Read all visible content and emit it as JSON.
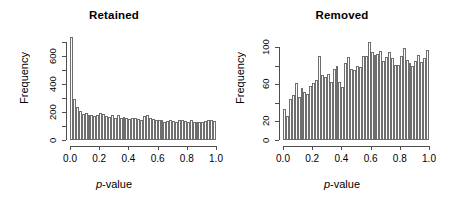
{
  "figure": {
    "background": "#ffffff",
    "bar_fill": "#fdfdfd",
    "bar_stroke": "#6e6e6e",
    "axis_color": "#4d4d4d"
  },
  "panels": [
    {
      "title": "Retained",
      "xlabel_italic": "p",
      "xlabel_rest": "-value",
      "ylabel": "Frequency"
    },
    {
      "title": "Removed",
      "xlabel_italic": "p",
      "xlabel_rest": "-value",
      "ylabel": "Frequency"
    }
  ],
  "chart_data": [
    {
      "type": "bar",
      "title": "Retained",
      "xlabel": "p-value",
      "ylabel": "Frequency",
      "xlim": [
        0,
        1
      ],
      "ylim": [
        0,
        740
      ],
      "xticks": [
        0.0,
        0.2,
        0.4,
        0.6,
        0.8,
        1.0
      ],
      "xtick_labels": [
        "0.0",
        "0.2",
        "0.4",
        "0.6",
        "0.8",
        "1.0"
      ],
      "yticks": [
        0,
        100,
        200,
        300,
        400,
        500,
        600,
        700
      ],
      "ytick_labels": [
        "0",
        "",
        "200",
        "",
        "400",
        "",
        "600",
        ""
      ],
      "grid": false,
      "legend": null,
      "bin_width": 0.02,
      "bin_centers": [
        0.01,
        0.03,
        0.05,
        0.07,
        0.09,
        0.11,
        0.13,
        0.15,
        0.17,
        0.19,
        0.21,
        0.23,
        0.25,
        0.27,
        0.29,
        0.31,
        0.33,
        0.35,
        0.37,
        0.39,
        0.41,
        0.43,
        0.45,
        0.47,
        0.49,
        0.51,
        0.53,
        0.55,
        0.57,
        0.59,
        0.61,
        0.63,
        0.65,
        0.67,
        0.69,
        0.71,
        0.73,
        0.75,
        0.77,
        0.79,
        0.81,
        0.83,
        0.85,
        0.87,
        0.89,
        0.91,
        0.93,
        0.95,
        0.97,
        0.99
      ],
      "values": [
        735,
        290,
        235,
        210,
        185,
        190,
        175,
        180,
        170,
        175,
        190,
        185,
        170,
        165,
        175,
        160,
        175,
        160,
        165,
        160,
        150,
        160,
        155,
        150,
        145,
        170,
        175,
        160,
        150,
        145,
        140,
        140,
        130,
        135,
        145,
        135,
        130,
        145,
        140,
        135,
        130,
        140,
        130,
        125,
        130,
        125,
        135,
        140,
        140,
        135
      ]
    },
    {
      "type": "bar",
      "title": "Removed",
      "xlabel": "p-value",
      "ylabel": "Frequency",
      "xlim": [
        0,
        1
      ],
      "ylim": [
        0,
        112
      ],
      "xticks": [
        0.0,
        0.2,
        0.4,
        0.6,
        0.8,
        1.0
      ],
      "xtick_labels": [
        "0.0",
        "0.2",
        "0.4",
        "0.6",
        "0.8",
        "1.0"
      ],
      "yticks": [
        0,
        20,
        40,
        60,
        80,
        100
      ],
      "ytick_labels": [
        "0",
        "20",
        "",
        "60",
        "",
        "100"
      ],
      "grid": false,
      "legend": null,
      "bin_width": 0.02,
      "bin_centers": [
        0.01,
        0.03,
        0.05,
        0.07,
        0.09,
        0.11,
        0.13,
        0.15,
        0.17,
        0.19,
        0.21,
        0.23,
        0.25,
        0.27,
        0.29,
        0.31,
        0.33,
        0.35,
        0.37,
        0.39,
        0.41,
        0.43,
        0.45,
        0.47,
        0.49,
        0.51,
        0.53,
        0.55,
        0.57,
        0.59,
        0.61,
        0.63,
        0.65,
        0.67,
        0.69,
        0.71,
        0.73,
        0.75,
        0.77,
        0.79,
        0.81,
        0.83,
        0.85,
        0.87,
        0.89,
        0.91,
        0.93,
        0.95,
        0.97,
        0.99
      ],
      "values": [
        33,
        26,
        44,
        48,
        61,
        46,
        56,
        52,
        50,
        58,
        61,
        65,
        91,
        70,
        68,
        71,
        63,
        77,
        80,
        62,
        57,
        83,
        89,
        76,
        75,
        80,
        79,
        91,
        90,
        106,
        95,
        92,
        93,
        96,
        85,
        89,
        95,
        88,
        81,
        81,
        90,
        99,
        86,
        83,
        80,
        85,
        92,
        84,
        88,
        97
      ]
    }
  ]
}
